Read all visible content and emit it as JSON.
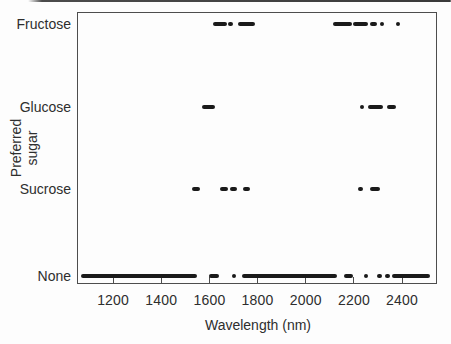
{
  "chart_data": {
    "type": "scatter",
    "title": "",
    "xlabel": "Wavelength (nm)",
    "ylabel": "Preferred sugar",
    "ylabel_lines": [
      "Preferred",
      "sugar"
    ],
    "categories": [
      "Fructose",
      "Glucose",
      "Sucrose",
      "None"
    ],
    "x_ticks": [
      1200,
      1400,
      1600,
      1800,
      2000,
      2200,
      2400
    ],
    "xlim": [
      1050,
      2545
    ],
    "grid": false,
    "legend": "none",
    "marker_color": "#1a1a1a",
    "axis_color": "#4d4d4d",
    "text_color": "#2e2e2e",
    "background_color": "#fdfdfd",
    "marker_style": "thick horizontal dashes and dots (overlapping selected wavelengths)",
    "series": [
      {
        "name": "Fructose",
        "segments_nm": [
          [
            1615,
            1672
          ],
          [
            1678,
            1698
          ],
          [
            1719,
            1790
          ],
          [
            2115,
            2191
          ],
          [
            2198,
            2260
          ],
          [
            2267,
            2297
          ],
          [
            2309,
            2327
          ],
          [
            2375,
            2392
          ]
        ]
      },
      {
        "name": "Glucose",
        "segments_nm": [
          [
            1570,
            1623
          ],
          [
            2226,
            2242
          ],
          [
            2260,
            2322
          ],
          [
            2336,
            2373
          ]
        ]
      },
      {
        "name": "Sucrose",
        "segments_nm": [
          [
            1528,
            1561
          ],
          [
            1644,
            1677
          ],
          [
            1685,
            1714
          ],
          [
            1739,
            1768
          ],
          [
            2217,
            2238
          ],
          [
            2267,
            2308
          ]
        ]
      },
      {
        "name": "None",
        "segments_nm": [
          [
            1067,
            1548
          ],
          [
            1598,
            1640
          ],
          [
            1693,
            1706
          ],
          [
            1735,
            2129
          ],
          [
            2158,
            2195
          ],
          [
            2240,
            2256
          ],
          [
            2297,
            2316
          ],
          [
            2330,
            2350
          ],
          [
            2357,
            2515
          ]
        ]
      }
    ]
  }
}
